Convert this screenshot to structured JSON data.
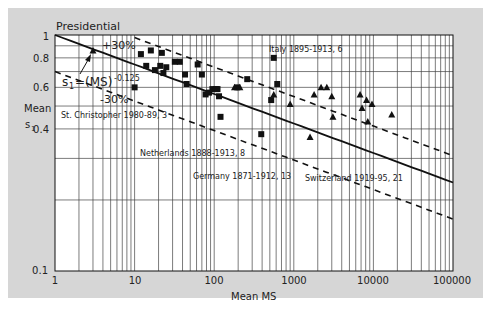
{
  "chart_data": {
    "type": "scatter",
    "title": "Presidential",
    "xlabel": "Mean MS",
    "ylabel": "Mean s1",
    "xscale": "log",
    "yscale": "log",
    "xlim": [
      1,
      100000
    ],
    "ylim": [
      0.1,
      1
    ],
    "x_ticks": [
      "1",
      "10",
      "100",
      "1000",
      "10000",
      "100000"
    ],
    "y_ticks": [
      "0.1",
      "0.4",
      "0.6",
      "0.8",
      "1"
    ],
    "grid": true,
    "curves": [
      {
        "name": "s1=(MS)^-0.125",
        "style": "solid",
        "formula": "s1 = MS^-0.125"
      },
      {
        "name": "+30%",
        "style": "dashed",
        "formula": "s1 = 1.3 * MS^-0.125"
      },
      {
        "name": "-30%",
        "style": "dashed",
        "formula": "s1 = 0.7 * MS^-0.125"
      }
    ],
    "annotations": [
      {
        "text": "+30%",
        "x": 4.5,
        "y": 0.92
      },
      {
        "text": "-30%",
        "x": 5.5,
        "y": 0.62
      },
      {
        "text": "s1=(MS)-0.125",
        "x": 1.3,
        "y": 0.74
      },
      {
        "text": "Italy 1895-1913, 6",
        "x": 500,
        "y": 0.9
      },
      {
        "text": "St. Christopher 1980-89, 3",
        "x": 1.5,
        "y": 0.55
      },
      {
        "text": "Netherlands 1888-1913, 8",
        "x": 16,
        "y": 0.42
      },
      {
        "text": "Germany 1871-1912, 13",
        "x": 45,
        "y": 0.37
      },
      {
        "text": "Switzerland 1919-95, 21",
        "x": 1400,
        "y": 0.37
      }
    ],
    "series": [
      {
        "name": "squares",
        "marker": "square",
        "points": [
          [
            10,
            0.6
          ],
          [
            12,
            0.83
          ],
          [
            14,
            0.74
          ],
          [
            16,
            0.86
          ],
          [
            18,
            0.71
          ],
          [
            21,
            0.74
          ],
          [
            22,
            0.84
          ],
          [
            23,
            0.69
          ],
          [
            25,
            0.73
          ],
          [
            32,
            0.77
          ],
          [
            37,
            0.77
          ],
          [
            43,
            0.68
          ],
          [
            45,
            0.62
          ],
          [
            62,
            0.75
          ],
          [
            70,
            0.68
          ],
          [
            78,
            0.56
          ],
          [
            86,
            0.57
          ],
          [
            95,
            0.59
          ],
          [
            105,
            0.59
          ],
          [
            110,
            0.59
          ],
          [
            115,
            0.55
          ],
          [
            120,
            0.45
          ],
          [
            195,
            0.6
          ],
          [
            260,
            0.65
          ],
          [
            390,
            0.38
          ],
          [
            520,
            0.53
          ],
          [
            560,
            0.8
          ],
          [
            620,
            0.62
          ]
        ]
      },
      {
        "name": "triangles",
        "marker": "triangle",
        "points": [
          [
            3,
            0.86
          ],
          [
            180,
            0.6
          ],
          [
            210,
            0.6
          ],
          [
            560,
            0.56
          ],
          [
            900,
            0.51
          ],
          [
            1600,
            0.37
          ],
          [
            1800,
            0.56
          ],
          [
            2200,
            0.6
          ],
          [
            2600,
            0.6
          ],
          [
            3000,
            0.55
          ],
          [
            3100,
            0.45
          ],
          [
            6800,
            0.56
          ],
          [
            7200,
            0.49
          ],
          [
            8200,
            0.53
          ],
          [
            8500,
            0.43
          ],
          [
            9600,
            0.51
          ],
          [
            17000,
            0.46
          ]
        ]
      }
    ]
  },
  "labels": {
    "title": "Presidential",
    "xlabel": "Mean MS",
    "ylabel_line1": "Mean",
    "ylabel_line2": "s",
    "ylabel_sub": "1",
    "formula_main": "s",
    "formula_sub": "1",
    "formula_rest": "=(MS)",
    "formula_exp": "-0.125",
    "plus30": "+30%",
    "minus30": "-30%",
    "italy": "Italy 1895-1913, 6",
    "stchris": "St. Christopher 1980-89, 3",
    "netherlands": "Netherlands 1888-1913, 8",
    "germany": "Germany 1871-1912, 13",
    "switzerland": "Switzerland 1919-95, 21",
    "xt1": "1",
    "xt10": "10",
    "xt100": "100",
    "xt1000": "1000",
    "xt10000": "10000",
    "xt100000": "100000",
    "yt1": "1",
    "yt08": "0.8",
    "yt06": "0.6",
    "yt04": "0.4",
    "yt01": "0.1"
  }
}
